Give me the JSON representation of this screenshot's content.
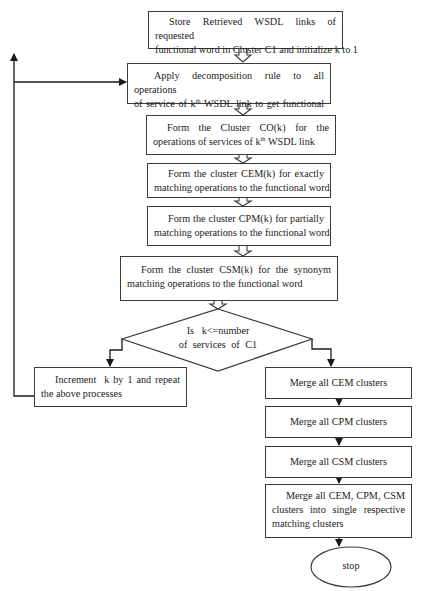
{
  "flowchart": {
    "steps": [
      {
        "id": "store-links",
        "line1": "Store Retrieved WSDL links of requested",
        "line2": "functional word in Cluster C1 and initialize k to 1"
      },
      {
        "id": "apply-decomposition",
        "line1": "Apply decomposition rule to all operations",
        "line2_pre": "of service of k",
        "line2_sup": "th",
        "line2_post": " WSDL link to get functional"
      },
      {
        "id": "form-co",
        "line1": "Form the Cluster CO(k) for the",
        "line2_pre": "operations of services of k",
        "line2_sup": "th",
        "line2_post": " WSDL link"
      },
      {
        "id": "form-cem",
        "line1": "Form the cluster CEM(k) for exactly",
        "line2": "matching operations to the functional word"
      },
      {
        "id": "form-cpm",
        "line1": "Form the cluster CPM(k) for partially",
        "line2": "matching operations to the functional word"
      },
      {
        "id": "form-csm",
        "line1": "Form the cluster CSM(k) for the synonym",
        "line2": "matching operations to the functional word"
      }
    ],
    "decision": {
      "line1": "Is   k<=number",
      "line2": "of services of C1"
    },
    "loop_step": {
      "line1": "Increment  k by 1 and repeat",
      "line2": "the above processes"
    },
    "merge_steps": [
      {
        "id": "merge-cem",
        "label": "Merge all CEM clusters"
      },
      {
        "id": "merge-cpm",
        "label": "Merge all CPM clusters"
      },
      {
        "id": "merge-csm",
        "label": "Merge all CSM clusters"
      },
      {
        "id": "merge-all",
        "line1": "Merge all CEM, CPM, CSM",
        "line2": "clusters into single respective",
        "line3": "matching clusters"
      }
    ],
    "terminal": {
      "label": "stop"
    },
    "colors": {
      "stroke": "#3a3a3a",
      "text": "#222222",
      "background": "#ffffff"
    }
  }
}
